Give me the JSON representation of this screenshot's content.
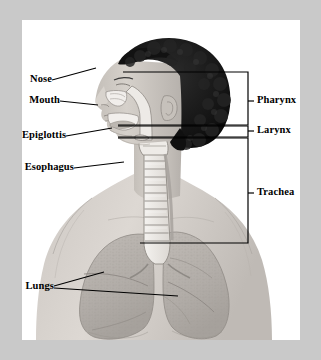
{
  "figure": {
    "border_color": "#c9c9c9",
    "canvas_color": "#ffffff",
    "line_color": "#000000",
    "hair_color": "#1a1a1a",
    "skin_color": "#cfcac4",
    "airway_color": "#efece8",
    "lung_color": "#b9b4b0"
  },
  "labels_left": [
    {
      "id": "nose",
      "text": "Nose",
      "x": 20,
      "y": 80
    },
    {
      "id": "mouth",
      "text": "Mouth",
      "x": 16,
      "y": 100
    },
    {
      "id": "epiglottis",
      "text": "Epiglottis",
      "x": 4,
      "y": 138
    },
    {
      "id": "esophagus",
      "text": "Esophagus",
      "x": 2,
      "y": 170
    },
    {
      "id": "lungs",
      "text": "Lungs",
      "x": 16,
      "y": 287
    }
  ],
  "labels_right": [
    {
      "id": "pharynx",
      "text": "Pharynx",
      "x": 256,
      "y": 101
    },
    {
      "id": "larynx",
      "text": "Larynx",
      "x": 256,
      "y": 131
    },
    {
      "id": "trachea",
      "text": "Trachea",
      "x": 256,
      "y": 193
    }
  ],
  "brackets": [
    {
      "id": "pharynx-bracket",
      "label": "Pharynx",
      "top": 72,
      "bottom": 125,
      "right": 248,
      "left": 123,
      "tick_y": 101
    },
    {
      "id": "larynx-bracket",
      "label": "Larynx",
      "top": 126,
      "bottom": 137,
      "right": 248,
      "left": 118,
      "tick_y": 131
    },
    {
      "id": "trachea-bracket",
      "label": "Trachea",
      "top": 138,
      "bottom": 243,
      "right": 248,
      "left": 140,
      "tick_y": 193
    }
  ],
  "leaders": [
    {
      "id": "nose-leader",
      "from": "Nose",
      "x1": 52,
      "y1": 80,
      "x2": 96,
      "y2": 68
    },
    {
      "id": "mouth-leader",
      "from": "Mouth",
      "x1": 60,
      "y1": 101,
      "x2": 98,
      "y2": 105
    },
    {
      "id": "epiglottis-leader",
      "from": "Epiglottis",
      "x1": 66,
      "y1": 136,
      "x2": 112,
      "y2": 128
    },
    {
      "id": "esophagus-leader",
      "from": "Esophagus",
      "x1": 74,
      "y1": 168,
      "x2": 124,
      "y2": 162
    },
    {
      "id": "lungs-leader-left",
      "from": "Lungs",
      "x1": 54,
      "y1": 286,
      "x2": 104,
      "y2": 272
    },
    {
      "id": "lungs-leader-right",
      "from": "Lungs",
      "x1": 54,
      "y1": 288,
      "x2": 178,
      "y2": 296
    }
  ]
}
